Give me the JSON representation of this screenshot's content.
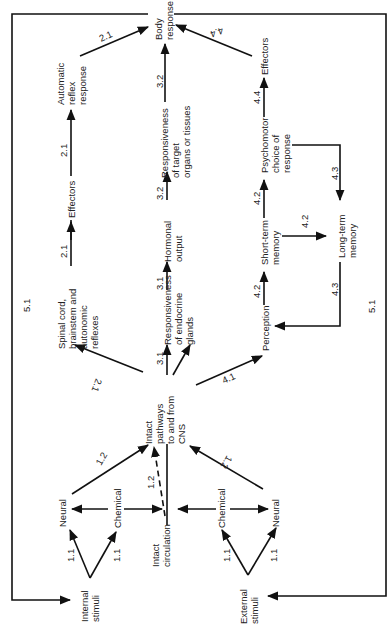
{
  "diagram": {
    "orientation": "rotated 90deg counter-clockwise",
    "nodes": {
      "internal_stimuli": [
        "Internal",
        "stimuli"
      ],
      "external_stimuli": [
        "External",
        "stimuli"
      ],
      "neural_internal": [
        "Neural"
      ],
      "chemical_internal": [
        "Chemical"
      ],
      "intact_circulation": [
        "Intact",
        "circulation"
      ],
      "chemical_external": [
        "Chemical"
      ],
      "neural_external": [
        "Neural"
      ],
      "intact_pathways": [
        "Intact",
        "pathways",
        "to and from",
        "CNS"
      ],
      "spinal_cord": [
        "Spinal cord,",
        "brainstem and",
        "autonomic",
        "reflexes"
      ],
      "effectors_reflex": [
        "Effectors"
      ],
      "automatic_reflex": [
        "Automatic",
        "reflex",
        "response"
      ],
      "responsiveness_endocrine": [
        "Responsiveness",
        "of endocrine",
        "glands"
      ],
      "hormonal_output": [
        "Hormonal",
        "output"
      ],
      "responsiveness_target": [
        "Responsiveness",
        "of target",
        "organs or tissues"
      ],
      "body_response": [
        "Body",
        "response"
      ],
      "perception": [
        "Perception"
      ],
      "short_term_memory": [
        "Short-term",
        "memory"
      ],
      "long_term_memory": [
        "Long-term",
        "memory"
      ],
      "psychomotor": [
        "Psychomotor",
        "choice of",
        "response"
      ],
      "effectors_psychomotor": [
        "Effectors"
      ]
    },
    "edge_labels": {
      "int_neural": "1.1",
      "int_chemical": "1.1",
      "ext_chemical": "1.1",
      "ext_neural": "1.1",
      "neural_to_cns": "1.2",
      "circ_to_cns": "1.2",
      "extneural_to_cns": "1.2",
      "cns_to_spinal": "2.1",
      "spinal_to_eff": "2.1",
      "eff_to_auto": "2.1",
      "auto_to_body": "2.1",
      "cns_to_endocrine": "3.1",
      "endocrine_to_hormonal": "3.1",
      "hormonal_to_target": "3.2",
      "target_to_body": "3.2",
      "cns_to_perception": "4.1",
      "perception_to_stm": "4.2",
      "stm_to_ltm": "4.2",
      "stm_to_psycho": "4.2",
      "ltm_to_perception": "4.3",
      "psycho_to_ltm": "4.3",
      "psycho_to_eff": "4.4",
      "eff_to_body": "4.4",
      "feedback_left": "5.1",
      "feedback_right": "5.1"
    }
  }
}
